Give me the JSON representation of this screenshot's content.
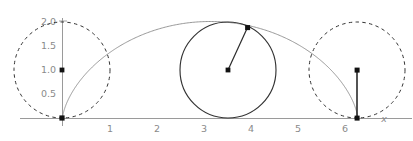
{
  "figure": {
    "background_color": "#ffffff"
  },
  "axes": {
    "x_axis": {
      "name": "x",
      "label": "x",
      "color": "#9a9a9a",
      "tick_labels": [
        "1",
        "2",
        "3",
        "4",
        "5",
        "6"
      ],
      "tick_values": [
        1,
        2,
        3,
        4,
        5,
        6
      ],
      "range": [
        -0.9,
        7.4
      ]
    },
    "y_axis": {
      "name": "y",
      "color": "#9a9a9a",
      "tick_labels": [
        "2.0",
        "1.5",
        "1.0",
        "0.5"
      ],
      "tick_values": [
        2.0,
        1.5,
        1.0,
        0.5
      ],
      "range": [
        -0.15,
        2.2
      ]
    }
  },
  "chart_data": {
    "type": "line",
    "xlabel": "x",
    "ylabel": "",
    "xlim": [
      -0.9,
      7.4
    ],
    "ylim": [
      -0.15,
      2.2
    ],
    "grid": false,
    "legend": "none",
    "series": [
      {
        "name": "cycloid",
        "kind": "parametric-curve",
        "equation_x": "t - sin(t)",
        "equation_y": "1 - cos(t)",
        "radius": 1,
        "t_range": [
          0,
          6.283185307
        ],
        "color": "#8c8c8c",
        "line_width": 0.9,
        "x": [
          0.0,
          0.0052,
          0.0409,
          0.1366,
          0.3178,
          0.6035,
          1.0043,
          1.5208,
          2.1427,
          2.8494,
          3.6126,
          4.3982,
          5.1704,
          5.8943,
          6.5398,
          7.0845,
          7.5158,
          7.832,
          8.042,
          8.1651,
          8.2268,
          8.2549
        ],
        "y": [
          0.0,
          0.0489,
          0.191,
          0.4122,
          0.691,
          1.0,
          1.309,
          1.5878,
          1.809,
          1.9511,
          2.0,
          1.9511,
          1.809,
          1.5878,
          1.309,
          1.0,
          0.691,
          0.4122,
          0.191,
          0.0489,
          0.0,
          0.0
        ]
      }
    ],
    "circles": [
      {
        "name": "rolling-circle-start",
        "center": [
          0.0,
          1.0
        ],
        "radius": 1.0,
        "style": "dashed",
        "color": "#333333",
        "center_marker": true,
        "radius_line": false
      },
      {
        "name": "rolling-circle-middle",
        "center": [
          3.5355,
          1.0
        ],
        "radius": 1.0,
        "style": "solid",
        "color": "#333333",
        "center_marker": true,
        "radius_line": true,
        "point_on_circle": [
          3.9506,
          1.8787
        ],
        "point_marker": true
      },
      {
        "name": "rolling-circle-end",
        "center": [
          6.2832,
          1.0
        ],
        "radius": 1.0,
        "style": "dashed",
        "color": "#333333",
        "center_marker": true,
        "radius_line": true,
        "point_on_circle": [
          6.2832,
          0.0
        ],
        "point_marker": true
      }
    ],
    "points": [
      {
        "name": "origin-point",
        "x": 0.0,
        "y": 0.0
      },
      {
        "name": "circle-start-center",
        "x": 0.0,
        "y": 1.0
      },
      {
        "name": "circle-middle-center",
        "x": 3.5355,
        "y": 1.0
      },
      {
        "name": "tracing-point-middle",
        "x": 3.9506,
        "y": 1.8787
      },
      {
        "name": "circle-end-center",
        "x": 6.2832,
        "y": 1.0
      },
      {
        "name": "end-point",
        "x": 6.2832,
        "y": 0.0
      }
    ]
  },
  "colors": {
    "curve": "#8c8c8c",
    "axis": "#9a9a9a",
    "circle": "#333333",
    "marker": "#1a1a1a",
    "tick_label": "#8a8a8a"
  }
}
